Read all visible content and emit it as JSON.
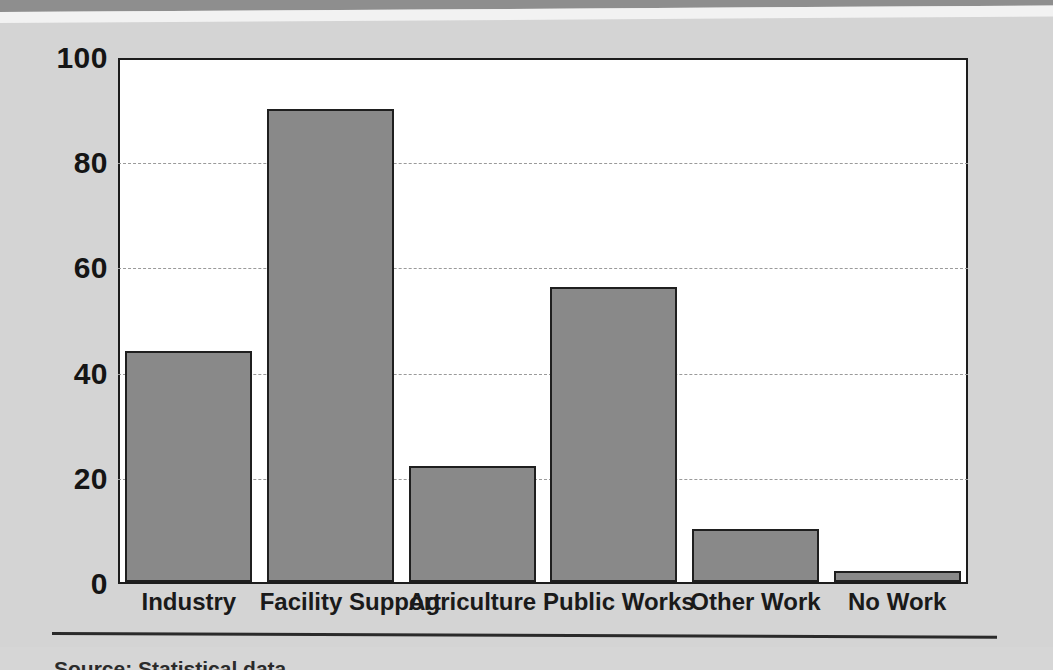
{
  "chart_data": {
    "type": "bar",
    "title": "",
    "subtitle": "",
    "xlabel": "",
    "ylabel": "",
    "categories": [
      "Industry",
      "Facility Support",
      "Agriculture",
      "Public Works",
      "Other Work",
      "No Work"
    ],
    "values": [
      44,
      90,
      22,
      56,
      10,
      2
    ],
    "series": [
      {
        "name": "Percent",
        "values": [
          44,
          90,
          22,
          56,
          10,
          2
        ]
      }
    ],
    "ylim": [
      0,
      100
    ],
    "yticks": [
      0,
      20,
      40,
      60,
      80,
      100
    ],
    "ytick_labels": [
      "0",
      "20",
      "40",
      "60",
      "80",
      "100"
    ],
    "gridlines": [
      20,
      40,
      60,
      80
    ],
    "grid": true,
    "grid_style": "dashed-horizontal",
    "legend": null,
    "legend_position": "none",
    "bar_color": "#898989",
    "bar_edge_color": "#1f1f1f",
    "plot_background": "#ffffff",
    "figure_background": "#d4d4d4",
    "axis_color": "#1d1d1d",
    "grid_color": "#9a9a9a"
  },
  "footer": {
    "source_note": "Source: Statistical data"
  }
}
